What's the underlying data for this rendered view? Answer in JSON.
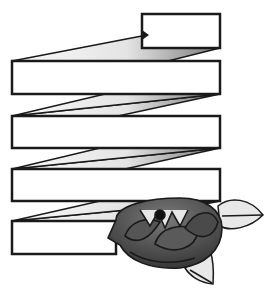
{
  "illustration": {
    "title": "Zigzag ribbon banner with rose",
    "colors": {
      "background": "#ffffff",
      "outline": "#1a1a1a",
      "ribbon_face": "#ffffff",
      "fold_light": "#f2f2f2",
      "fold_dark": "#8a8a8a",
      "rose_dark": "#3a3a3a",
      "rose_mid": "#6a6a6a",
      "leaf": "#e6e6e6"
    },
    "banners": [
      {
        "label": "",
        "x": 142,
        "y": 14,
        "w": 78,
        "h": 34
      },
      {
        "label": "",
        "x": 12,
        "y": 61,
        "w": 208,
        "h": 33
      },
      {
        "label": "",
        "x": 12,
        "y": 116,
        "w": 208,
        "h": 32
      },
      {
        "label": "",
        "x": 12,
        "y": 169,
        "w": 208,
        "h": 32
      },
      {
        "label": "",
        "x": 12,
        "y": 221,
        "w": 104,
        "h": 33
      }
    ]
  }
}
